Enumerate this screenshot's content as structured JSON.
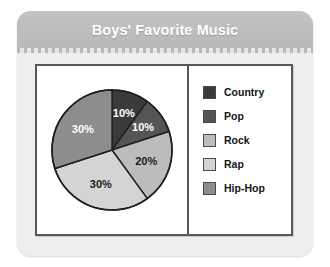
{
  "card": {
    "title": "Boys' Favorite Music"
  },
  "chart_data": {
    "type": "pie",
    "title": "Boys' Favorite Music",
    "xlabel": "",
    "ylabel": "",
    "unit": "percent",
    "legend_position": "right",
    "grid": false,
    "categories": [
      "Country",
      "Pop",
      "Rock",
      "Rap",
      "Hip-Hop"
    ],
    "values": [
      10,
      10,
      20,
      30,
      30
    ],
    "labels": [
      "10%",
      "10%",
      "20%",
      "30%",
      "30%"
    ],
    "colors": [
      "#3a3a3a",
      "#555555",
      "#bcbcbc",
      "#d4d4d4",
      "#8d8d8d"
    ],
    "label_colors": [
      "#ffffff",
      "#ffffff",
      "#1a1a1a",
      "#1a1a1a",
      "#ffffff"
    ],
    "slices": [
      {
        "name": "Country",
        "value": 10,
        "label": "10%",
        "color": "#3a3a3a",
        "label_color": "#ffffff"
      },
      {
        "name": "Pop",
        "value": 10,
        "label": "10%",
        "color": "#555555",
        "label_color": "#ffffff"
      },
      {
        "name": "Rock",
        "value": 20,
        "label": "20%",
        "color": "#bcbcbc",
        "label_color": "#1a1a1a"
      },
      {
        "name": "Rap",
        "value": 30,
        "label": "30%",
        "color": "#d4d4d4",
        "label_color": "#1a1a1a"
      },
      {
        "name": "Hip-Hop",
        "value": 30,
        "label": "30%",
        "color": "#8d8d8d",
        "label_color": "#ffffff"
      }
    ]
  },
  "legend": {
    "items": [
      {
        "label": "Country",
        "color": "#3a3a3a"
      },
      {
        "label": "Pop",
        "color": "#555555"
      },
      {
        "label": "Rock",
        "color": "#bcbcbc"
      },
      {
        "label": "Rap",
        "color": "#d4d4d4"
      },
      {
        "label": "Hip-Hop",
        "color": "#8d8d8d"
      }
    ]
  },
  "style": {
    "header_bg": "#bdbdbd",
    "card_bg": "#eeeeee",
    "panel_bg": "#ffffff",
    "border": "#585858",
    "title_color": "#ffffff"
  }
}
